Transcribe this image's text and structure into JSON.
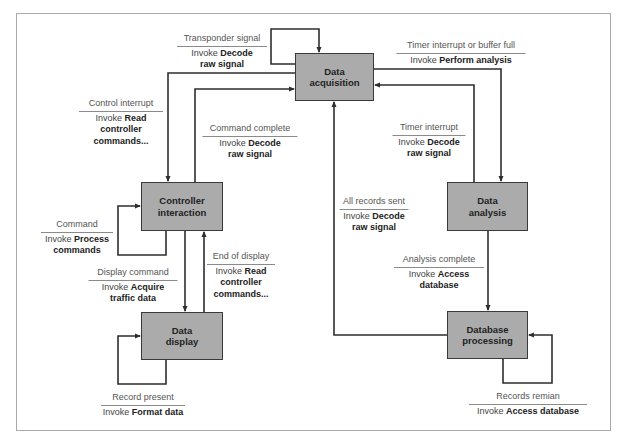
{
  "diagram": {
    "type": "state-transition",
    "states": [
      {
        "id": "data-acquisition",
        "line1": "Data",
        "line2": "acquisition"
      },
      {
        "id": "controller-interaction",
        "line1": "Controller",
        "line2": "interaction"
      },
      {
        "id": "data-display",
        "line1": "Data",
        "line2": "display"
      },
      {
        "id": "data-analysis",
        "line1": "Data",
        "line2": "analysis"
      },
      {
        "id": "database-processing",
        "line1": "Database",
        "line2": "processing"
      }
    ],
    "transitions": [
      {
        "id": "transponder",
        "from": "data-acquisition",
        "to": "data-acquisition",
        "condition": "Transponder signal",
        "prefix": "Invoke",
        "action1": "Decode",
        "action2": "raw signal"
      },
      {
        "id": "timer-buffer",
        "from": "data-acquisition",
        "to": "data-analysis",
        "condition": "Timer interrupt or buffer full",
        "prefix": "Invoke",
        "action1": "Perform analysis",
        "action2": ""
      },
      {
        "id": "control-interrupt",
        "from": "data-acquisition",
        "to": "controller-interaction",
        "condition": "Control interrupt",
        "prefix": "Invoke",
        "action1": "Read",
        "action2": "controller",
        "action3": "commands..."
      },
      {
        "id": "command-complete",
        "from": "controller-interaction",
        "to": "data-acquisition",
        "condition": "Command complete",
        "prefix": "Invoke",
        "action1": "Decode",
        "action2": "raw signal"
      },
      {
        "id": "timer-interrupt",
        "from": "data-analysis",
        "to": "data-acquisition",
        "condition": "Timer interrupt",
        "prefix": "Invoke",
        "action1": "Decode",
        "action2": "raw signal"
      },
      {
        "id": "all-records-sent",
        "from": "database-processing",
        "to": "data-acquisition",
        "condition": "All records sent",
        "prefix": "Invoke",
        "action1": "Decode",
        "action2": "raw signal"
      },
      {
        "id": "command",
        "from": "controller-interaction",
        "to": "controller-interaction",
        "condition": "Command",
        "prefix": "Invoke",
        "action1": "Process",
        "action2": "commands"
      },
      {
        "id": "end-of-display",
        "from": "data-display",
        "to": "controller-interaction",
        "condition": "End of display",
        "prefix": "Invoke",
        "action1": "Read",
        "action2": "controller",
        "action3": "commands..."
      },
      {
        "id": "display-command",
        "from": "controller-interaction",
        "to": "data-display",
        "condition": "Display command",
        "prefix": "Invoke",
        "action1": "Acquire",
        "action2": "traffic data"
      },
      {
        "id": "analysis-complete",
        "from": "data-analysis",
        "to": "database-processing",
        "condition": "Analysis complete",
        "prefix": "Invoke",
        "action1": "Access",
        "action2": "database"
      },
      {
        "id": "record-present",
        "from": "data-display",
        "to": "data-display",
        "condition": "Record present",
        "prefix": "Invoke",
        "action1": "Format data",
        "action2": ""
      },
      {
        "id": "records-remain",
        "from": "database-processing",
        "to": "database-processing",
        "condition": "Records remian",
        "prefix": "Invoke",
        "action1": "Access database",
        "action2": ""
      }
    ],
    "colors": {
      "state_fill": "#ababab",
      "state_border": "#3a3a3a",
      "line": "#2e2e2e",
      "frame": "#a9a9a9",
      "rule": "#8a8a8a"
    }
  }
}
